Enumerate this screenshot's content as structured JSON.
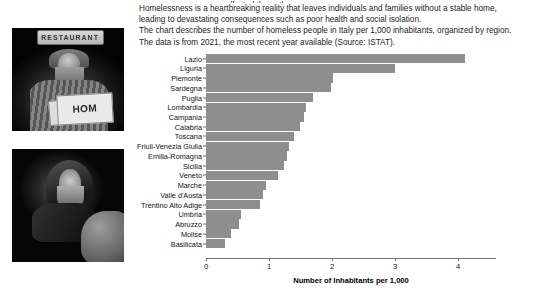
{
  "photos": [
    {
      "name": "homeless-man-with-cardboard-sign-photo",
      "sign_text": "RESTAURANT",
      "placard_text": "HOM",
      "placard_text_small": "H"
    },
    {
      "name": "homeless-man-resting-photo"
    }
  ],
  "intro": {
    "clipped_line": "some regions are more affected than others.",
    "line1": "Homelessness is a heartbreaking reality that leaves individuals and families without a stable home,",
    "line2": "leading to devastating consequences such as poor health and social isolation.",
    "line3": "The chart describes the number of homeless people in Italy per 1,000 inhabitants, organized by region.",
    "line4": "The data is from 2021, the most recent year available (Source: ISTAT)."
  },
  "chart_data": {
    "type": "bar",
    "orientation": "horizontal",
    "title": "",
    "xlabel": "Number of Inhabitants per 1,000",
    "ylabel": "",
    "xlim": [
      0,
      4.6
    ],
    "xticks": [
      0,
      1,
      2,
      3,
      4
    ],
    "xtick_labels": [
      "0",
      "1",
      "2",
      "3",
      "4"
    ],
    "grid": false,
    "bar_color": "#8e8e8e",
    "categories": [
      "Lazio",
      "Liguria",
      "Piemonte",
      "Sardegna",
      "Puglia",
      "Lombardia",
      "Campania",
      "Calabria",
      "Toscana",
      "Friuli-Venezia Giulia",
      "Emilia-Romagna",
      "Sicilia",
      "Veneto",
      "Marche",
      "Valle d'Aosta",
      "Trentino Alto Adige",
      "Umbria",
      "Abruzzo",
      "Molise",
      "Basilicata"
    ],
    "values": [
      4.11,
      2.99,
      2.02,
      1.99,
      1.7,
      1.59,
      1.56,
      1.49,
      1.39,
      1.32,
      1.28,
      1.24,
      1.14,
      0.95,
      0.9,
      0.85,
      0.55,
      0.52,
      0.39,
      0.3
    ]
  }
}
